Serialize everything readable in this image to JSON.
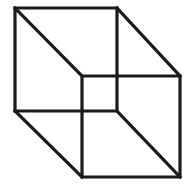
{
  "figure": {
    "name": "Necker cube",
    "type": "optical-illusion-line-drawing",
    "background_color": "#ffffff",
    "stroke_color": "#1a1a1a",
    "stroke_width": 3.2,
    "canvas": {
      "width": 194,
      "height": 193
    }
  },
  "chart_data": {
    "type": "line",
    "xlabel": "",
    "ylabel": "",
    "xlim": [
      0,
      194
    ],
    "ylim": [
      0,
      193
    ],
    "grid": false,
    "legend": "none",
    "vertices": {
      "rear_top_left": [
        15,
        8
      ],
      "rear_top_right": [
        117,
        8
      ],
      "rear_bottom_right": [
        117,
        111
      ],
      "rear_bottom_left": [
        15,
        111
      ],
      "front_top_left": [
        82,
        76
      ],
      "front_top_right": [
        180,
        76
      ],
      "front_bottom_right": [
        180,
        177
      ],
      "front_bottom_left": [
        82,
        177
      ]
    },
    "series": [
      {
        "name": "rear-square",
        "closed": true,
        "points": [
          [
            15,
            8
          ],
          [
            117,
            8
          ],
          [
            117,
            111
          ],
          [
            15,
            111
          ]
        ]
      },
      {
        "name": "front-square",
        "closed": true,
        "points": [
          [
            82,
            76
          ],
          [
            180,
            76
          ],
          [
            180,
            177
          ],
          [
            82,
            177
          ]
        ]
      },
      {
        "name": "connector-top-left",
        "closed": false,
        "points": [
          [
            15,
            8
          ],
          [
            82,
            76
          ]
        ]
      },
      {
        "name": "connector-top-right",
        "closed": false,
        "points": [
          [
            117,
            8
          ],
          [
            180,
            76
          ]
        ]
      },
      {
        "name": "connector-bottom-left",
        "closed": false,
        "points": [
          [
            15,
            111
          ],
          [
            82,
            177
          ]
        ]
      },
      {
        "name": "connector-bottom-right",
        "closed": false,
        "points": [
          [
            117,
            111
          ],
          [
            180,
            177
          ]
        ]
      }
    ]
  }
}
